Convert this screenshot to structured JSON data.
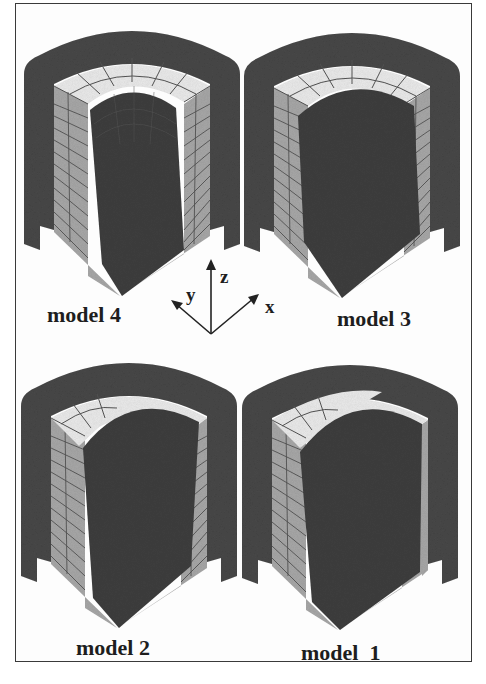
{
  "figure": {
    "models": [
      {
        "id": "model4",
        "label": "model 4",
        "position": "top-left"
      },
      {
        "id": "model3",
        "label": "model 3",
        "position": "top-right"
      },
      {
        "id": "model2",
        "label": "model 2",
        "position": "bottom-left"
      },
      {
        "id": "model1",
        "label": "model  1",
        "position": "bottom-right"
      }
    ],
    "axes": {
      "x": "x",
      "y": "y",
      "z": "z"
    },
    "colors": {
      "shell": "#4a4a4a",
      "core": "#3f3f3f",
      "mesh_face": "#a9a9a9",
      "top_ring": "#ececec",
      "mesh_line": "#505050",
      "frame": "#3a3a3a",
      "background": "#fdfdfd"
    }
  }
}
